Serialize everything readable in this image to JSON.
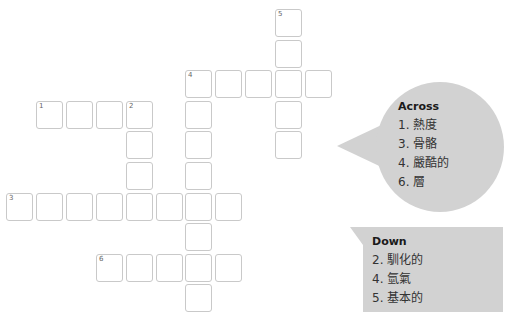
{
  "puzzle": {
    "cell_w": 29.9,
    "cell_h": 30.6,
    "origin_x": 6,
    "origin_y": 9,
    "words": [
      {
        "number": 5,
        "direction": "down",
        "row": 0,
        "col": 9,
        "length": 5
      },
      {
        "number": 4,
        "direction": "across",
        "row": 2,
        "col": 6,
        "length": 5
      },
      {
        "number": 4,
        "direction": "down",
        "row": 2,
        "col": 6,
        "length": 8
      },
      {
        "number": 1,
        "direction": "across",
        "row": 3,
        "col": 1,
        "length": 4
      },
      {
        "number": 2,
        "direction": "down",
        "row": 3,
        "col": 4,
        "length": 4
      },
      {
        "number": 3,
        "direction": "across",
        "row": 6,
        "col": 0,
        "length": 8
      },
      {
        "number": 6,
        "direction": "across",
        "row": 8,
        "col": 3,
        "length": 5
      }
    ]
  },
  "across": {
    "title": "Across",
    "clues": [
      "1. 熱度",
      "3. 骨骼",
      "4. 嚴酷的",
      "6. 層"
    ]
  },
  "down": {
    "title": "Down",
    "clues": [
      "2. 馴化的",
      "4. 氫氣",
      "5. 基本的"
    ]
  },
  "colors": {
    "bubble": "#d2d2d2",
    "cell_border": "#c9c9c9"
  }
}
